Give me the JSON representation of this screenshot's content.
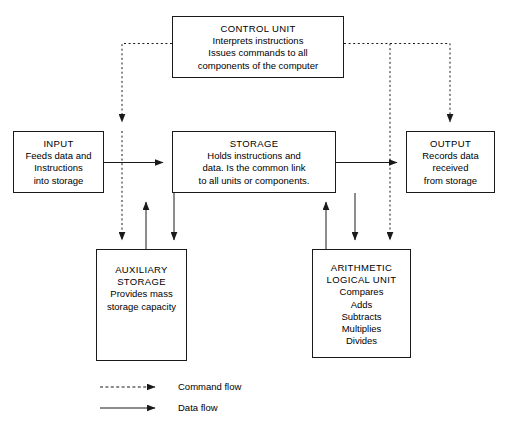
{
  "diagram": {
    "nodes": [
      {
        "id": "control-unit",
        "name": "control-unit-box",
        "title": "CONTROL UNIT",
        "lines": [
          "CONTROL UNIT",
          "Interprets instructions",
          "Issues commands to all",
          "components of the computer"
        ],
        "x": 172,
        "y": 16,
        "w": 172,
        "h": 62
      },
      {
        "id": "input",
        "name": "input-box",
        "title": "INPUT",
        "lines": [
          "INPUT",
          "Feeds data and",
          "Instructions",
          "into storage"
        ],
        "x": 13,
        "y": 131,
        "w": 91,
        "h": 62
      },
      {
        "id": "storage",
        "name": "storage-box",
        "title": "STORAGE",
        "lines": [
          "STORAGE",
          "Holds instructions and",
          "data. Is the common link",
          "to all units or components."
        ],
        "x": 172,
        "y": 131,
        "w": 164,
        "h": 62
      },
      {
        "id": "output",
        "name": "output-box",
        "title": "OUTPUT",
        "lines": [
          "OUTPUT",
          "Records data",
          "received",
          "from storage"
        ],
        "x": 406,
        "y": 131,
        "w": 89,
        "h": 62
      },
      {
        "id": "auxiliary-storage",
        "name": "auxiliary-storage-box",
        "title": "AUXILIARY STORAGE",
        "lines": [
          "AUXILIARY",
          "STORAGE",
          "Provides mass",
          "storage capacity"
        ],
        "x": 96,
        "y": 249,
        "w": 91,
        "h": 112
      },
      {
        "id": "arithmetic-logical-unit",
        "name": "arithmetic-logical-unit-box",
        "title": "ARITHMETIC LOGICAL UNIT",
        "lines": [
          "ARITHMETIC",
          "LOGICAL UNIT",
          "Compares",
          "Adds",
          "Subtracts",
          "Multiplies",
          "Divides"
        ],
        "x": 312,
        "y": 249,
        "w": 99,
        "h": 109
      }
    ],
    "legend": {
      "items": [
        {
          "id": "command-flow",
          "label": "Command flow",
          "style": "dashed"
        },
        {
          "id": "data-flow",
          "label": "Data flow",
          "style": "solid"
        }
      ]
    },
    "edges": [
      {
        "id": "control-to-input",
        "type": "command",
        "from": "control-unit",
        "to": "input"
      },
      {
        "id": "control-to-auxiliary-storage",
        "type": "command",
        "from": "control-unit",
        "to": "auxiliary-storage"
      },
      {
        "id": "control-to-output",
        "type": "command",
        "from": "control-unit",
        "to": "output"
      },
      {
        "id": "control-to-arithmetic-logical-unit",
        "type": "command",
        "from": "control-unit",
        "to": "arithmetic-logical-unit"
      },
      {
        "id": "input-to-storage",
        "type": "data",
        "from": "input",
        "to": "storage"
      },
      {
        "id": "storage-to-output",
        "type": "data",
        "from": "storage",
        "to": "output"
      },
      {
        "id": "storage-to-auxiliary-storage",
        "type": "data",
        "from": "storage",
        "to": "auxiliary-storage"
      },
      {
        "id": "auxiliary-storage-to-storage",
        "type": "data",
        "from": "auxiliary-storage",
        "to": "storage"
      },
      {
        "id": "storage-to-arithmetic-logical-unit",
        "type": "data",
        "from": "storage",
        "to": "arithmetic-logical-unit"
      },
      {
        "id": "arithmetic-logical-unit-to-storage",
        "type": "data",
        "from": "arithmetic-logical-unit",
        "to": "storage"
      }
    ],
    "colors": {
      "stroke": "#1a1a1a",
      "background": "#ffffff",
      "text": "#000000"
    }
  }
}
